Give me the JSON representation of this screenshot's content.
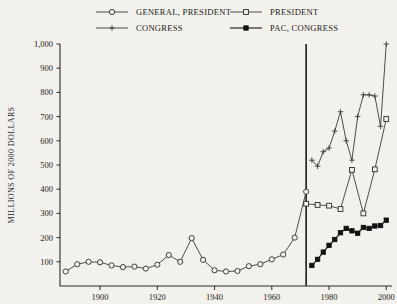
{
  "chart_data": {
    "type": "line",
    "title": "",
    "xlabel": "",
    "ylabel": "MILLIONS OF 2000 DOLLARS",
    "xlim": [
      1886,
      2002
    ],
    "ylim": [
      0,
      1000
    ],
    "grid": false,
    "legend_position": "top",
    "xticks": [
      1900,
      1920,
      1940,
      1960,
      1980,
      2000
    ],
    "xtick_labels": [
      "1900",
      "1920",
      "1940",
      "1960",
      "1980",
      "2000"
    ],
    "yticks": [
      100,
      200,
      300,
      400,
      500,
      600,
      700,
      800,
      900,
      1000
    ],
    "ytick_labels": [
      "100",
      "200",
      "300",
      "400",
      "500",
      "600",
      "700",
      "800",
      "900",
      "1,000"
    ],
    "annotations": [
      {
        "type": "vline",
        "x": 1972,
        "label": "",
        "note": "vertical reference line at 1972"
      }
    ],
    "series": [
      {
        "name": "GENERAL, PRESIDENT",
        "marker": "open-circle",
        "x": [
          1888,
          1892,
          1896,
          1900,
          1904,
          1908,
          1912,
          1916,
          1920,
          1924,
          1928,
          1932,
          1936,
          1940,
          1944,
          1948,
          1952,
          1956,
          1960,
          1964,
          1968,
          1972
        ],
        "values": [
          60,
          90,
          100,
          98,
          85,
          78,
          80,
          72,
          88,
          128,
          100,
          198,
          108,
          65,
          60,
          62,
          82,
          90,
          110,
          130,
          200,
          390
        ]
      },
      {
        "name": "PRESIDENT",
        "marker": "open-square",
        "x": [
          1972,
          1976,
          1980,
          1984,
          1988,
          1992,
          1996,
          2000
        ],
        "values": [
          340,
          335,
          332,
          318,
          480,
          300,
          482,
          690
        ]
      },
      {
        "name": "CONGRESS",
        "marker": "cross",
        "x": [
          1974,
          1976,
          1978,
          1980,
          1982,
          1984,
          1986,
          1988,
          1990,
          1992,
          1994,
          1996,
          1998,
          2000
        ],
        "values": [
          520,
          495,
          555,
          570,
          640,
          720,
          600,
          520,
          700,
          790,
          790,
          785,
          660,
          1000
        ]
      },
      {
        "name": "PAC, CONGRESS",
        "marker": "filled-square",
        "x": [
          1974,
          1976,
          1978,
          1980,
          1982,
          1984,
          1986,
          1988,
          1990,
          1992,
          1994,
          1996,
          1998,
          2000
        ],
        "values": [
          85,
          110,
          140,
          168,
          192,
          220,
          238,
          228,
          218,
          242,
          238,
          248,
          250,
          272
        ]
      }
    ]
  },
  "legend": {
    "items": [
      {
        "label": "GENERAL, PRESIDENT",
        "marker": "open-circle"
      },
      {
        "label": "PRESIDENT",
        "marker": "open-square"
      },
      {
        "label": "CONGRESS",
        "marker": "cross"
      },
      {
        "label": "PAC, CONGRESS",
        "marker": "filled-square"
      }
    ]
  },
  "colors": {
    "background": "#f2f1ec",
    "axis": "#2a2a2a",
    "line": "#3a3a3a",
    "pac_line": "#111111",
    "divider": "#1a1a1a"
  }
}
